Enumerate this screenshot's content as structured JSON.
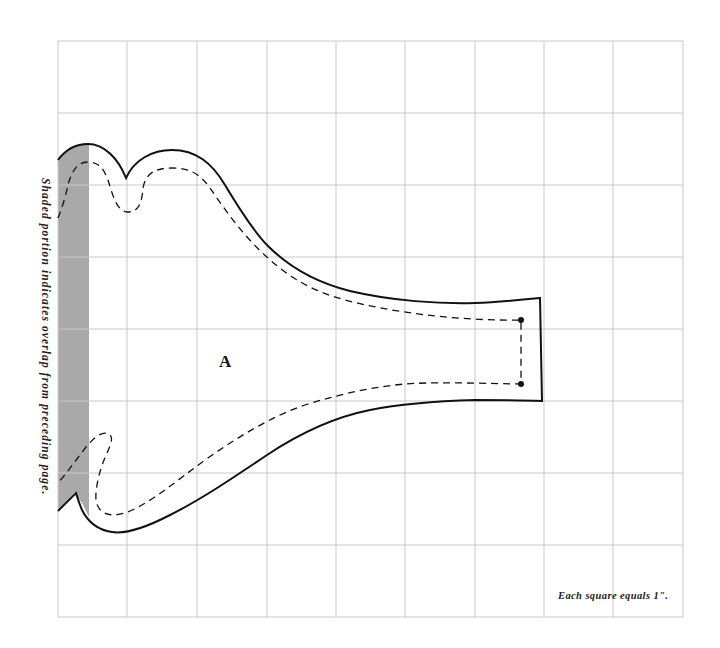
{
  "diagram": {
    "type": "sewing-pattern-piece",
    "piece_label": "A",
    "side_note": "Shaded portion indicates overlap from preceding page.",
    "scale_note": "Each square equals 1\".",
    "grid": {
      "columns": 9,
      "rows": 8,
      "unit": "1 inch per square",
      "line_color": "#c8c8c8"
    },
    "colors": {
      "background": "#ffffff",
      "outline": "#111111",
      "seam_line": "#111111",
      "overlap_shading": "#a9a9a9"
    },
    "legend": {
      "solid_line": "cutting line",
      "dashed_line": "stitching line",
      "dots": "seam end markers",
      "shaded_strip": "overlap from preceding page"
    }
  }
}
